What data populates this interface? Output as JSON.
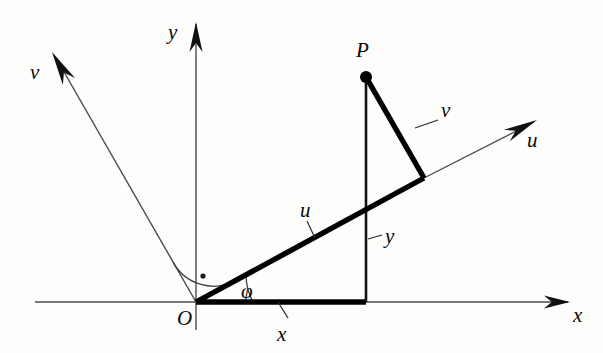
{
  "figure": {
    "background_color": "#fdfdfb",
    "ink_color": "#000000",
    "width": 603,
    "height": 353
  },
  "labels": {
    "y_axis": "y",
    "x_axis": "x",
    "u_axis": "u",
    "v_axis": "v",
    "origin": "O",
    "point_p": "P",
    "angle_phi": "φ",
    "segment_u": "u",
    "segment_v": "v",
    "segment_x": "x",
    "segment_y": "y"
  },
  "geometry": {
    "origin": {
      "x": 196,
      "y": 302
    },
    "point_p": {
      "x": 366,
      "y": 77
    },
    "foot_on_x_axis": {
      "x": 366,
      "y": 302
    },
    "foot_on_u_axis": {
      "x": 424,
      "y": 178
    },
    "phi_degrees": 28.5,
    "x_axis": {
      "left_x": 35,
      "tip_x": 570,
      "y": 302
    },
    "y_axis": {
      "x": 196,
      "top_y": 22,
      "bottom_y": 330
    },
    "u_axis": {
      "tip_x": 537,
      "tip_y": 120
    },
    "v_axis": {
      "tip_x": 52,
      "tip_y": 52
    },
    "phi_arc_radius": 57,
    "right_angle_arc_radius": 46,
    "right_angle_dot": {
      "x": 199,
      "y": 278
    }
  },
  "label_positions": {
    "y_axis": {
      "left": 168,
      "top": 22
    },
    "x_axis": {
      "left": 573,
      "top": 305
    },
    "u_axis": {
      "left": 527,
      "top": 130
    },
    "v_axis": {
      "left": 30,
      "top": 62
    },
    "origin": {
      "left": 177,
      "top": 308
    },
    "point_p": {
      "left": 356,
      "top": 40
    },
    "angle_phi": {
      "left": 241,
      "top": 281
    },
    "segment_u": {
      "left": 300,
      "top": 200
    },
    "segment_v": {
      "left": 441,
      "top": 100
    },
    "segment_x": {
      "left": 277,
      "top": 324
    },
    "segment_y": {
      "left": 385,
      "top": 226
    }
  },
  "leaders": [
    {
      "name": "u-segment-leader",
      "x1": 307,
      "y1": 221,
      "x2": 315,
      "y2": 238
    },
    {
      "name": "v-segment-leader",
      "x1": 438,
      "y1": 120,
      "x2": 415,
      "y2": 128
    },
    {
      "name": "x-segment-leader",
      "x1": 288,
      "y1": 318,
      "x2": 278,
      "y2": 302
    },
    {
      "name": "y-segment-leader",
      "x1": 382,
      "y1": 235,
      "x2": 368,
      "y2": 239
    }
  ]
}
